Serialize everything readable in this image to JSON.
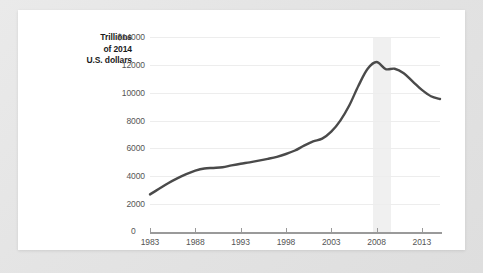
{
  "card": {
    "background": "#ffffff",
    "page_background": "#e8e8e8"
  },
  "chart_data": {
    "type": "line",
    "title": "",
    "subtitle": "",
    "xlabel": "",
    "ylabel": "Trillions of 2014 U.S. dollars",
    "ylabel_lines": [
      "Trillions",
      "of 2014",
      "U.S. dollars"
    ],
    "ytick_labels": [
      "$14000",
      "12000",
      "10000",
      "8000",
      "6000",
      "4000",
      "2000",
      "0"
    ],
    "ytick_values": [
      14000,
      12000,
      10000,
      8000,
      6000,
      4000,
      2000,
      0
    ],
    "ylim": [
      0,
      14000
    ],
    "xtick_labels": [
      "1983",
      "1988",
      "1993",
      "1998",
      "2003",
      "2008",
      "2013"
    ],
    "xtick_values": [
      1983,
      1988,
      1993,
      1998,
      2003,
      2008,
      2013
    ],
    "xlim": [
      1983,
      2015
    ],
    "grid": "horizontal",
    "legend": "none",
    "line_color": "#4a4a4a",
    "line_width": 2.4,
    "annotations": [
      {
        "type": "vspan",
        "name": "recession-band",
        "x_start": 2007.6,
        "x_end": 2009.6,
        "color": "#f0f0f0"
      }
    ],
    "x": [
      1983,
      1984,
      1985,
      1986,
      1987,
      1988,
      1989,
      1990,
      1991,
      1992,
      1993,
      1994,
      1995,
      1996,
      1997,
      1998,
      1999,
      2000,
      2001,
      2002,
      2003,
      2004,
      2005,
      2006,
      2007,
      2008,
      2009,
      2010,
      2011,
      2012,
      2013,
      2014,
      2015
    ],
    "values": [
      2700,
      3100,
      3500,
      3850,
      4150,
      4400,
      4560,
      4600,
      4650,
      4780,
      4900,
      5000,
      5120,
      5250,
      5400,
      5600,
      5850,
      6200,
      6500,
      6700,
      7200,
      8000,
      9100,
      10500,
      11700,
      12200,
      11700,
      11720,
      11400,
      10800,
      10200,
      9750,
      9550
    ],
    "series": [
      {
        "name": "Total value",
        "values": [
          2700,
          3100,
          3500,
          3850,
          4150,
          4400,
          4560,
          4600,
          4650,
          4780,
          4900,
          5000,
          5120,
          5250,
          5400,
          5600,
          5850,
          6200,
          6500,
          6700,
          7200,
          8000,
          9100,
          10500,
          11700,
          12200,
          11700,
          11720,
          11400,
          10800,
          10200,
          9750,
          9550
        ]
      }
    ]
  }
}
